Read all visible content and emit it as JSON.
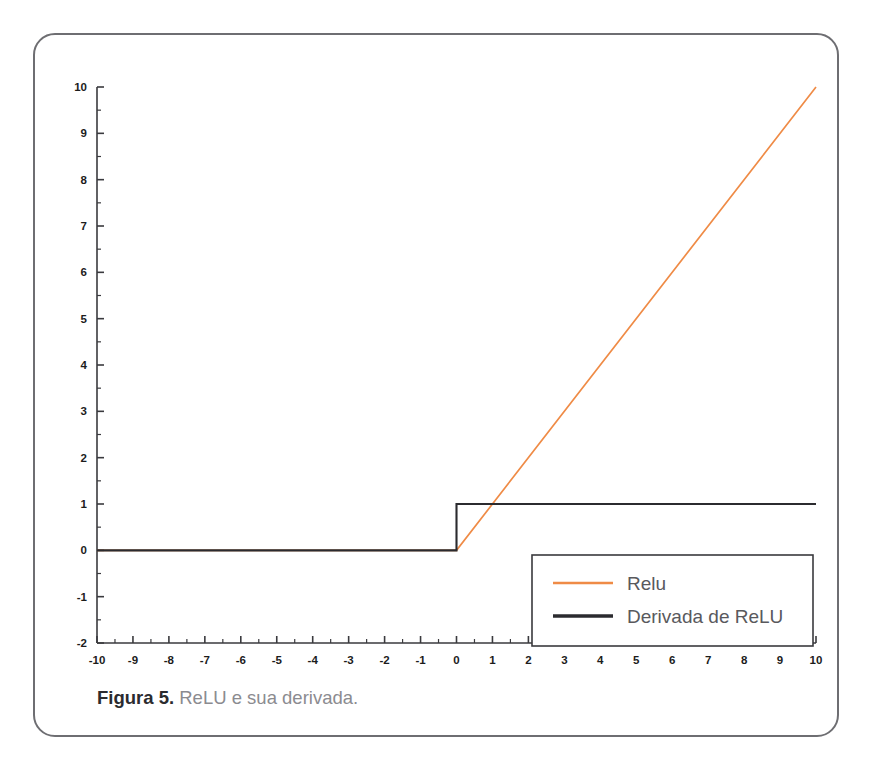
{
  "figure": {
    "caption_prefix": "Figura 5.",
    "caption_text": "ReLU e sua derivada."
  },
  "colors": {
    "relu_line": "#ef8b46",
    "derivative_line": "#2b2b2f",
    "axis": "#3a3a3e",
    "card_border": "#6e6e72",
    "caption_text": "#8b8b90",
    "caption_bold": "#2b2b2f",
    "legend_text": "#59595d",
    "background": "#ffffff"
  },
  "chart_data": {
    "type": "line",
    "title": "",
    "xlabel": "",
    "ylabel": "",
    "xlim": [
      -10,
      10
    ],
    "ylim": [
      -2,
      10
    ],
    "grid": false,
    "x_ticks": [
      -10,
      -9,
      -8,
      -7,
      -6,
      -5,
      -4,
      -3,
      -2,
      -1,
      0,
      1,
      2,
      3,
      4,
      5,
      6,
      7,
      8,
      9,
      10
    ],
    "x_tick_labels": [
      "-10",
      "-9",
      "-8",
      "-7",
      "-6",
      "-5",
      "-4",
      "-3",
      "-2",
      "-1",
      "0",
      "1",
      "2",
      "3",
      "4",
      "5",
      "6",
      "7",
      "8",
      "9",
      "10"
    ],
    "y_ticks": [
      -2,
      -1,
      0,
      1,
      2,
      3,
      4,
      5,
      6,
      7,
      8,
      9,
      10
    ],
    "y_tick_labels": [
      "-2",
      "-1",
      "0",
      "1",
      "2",
      "3",
      "4",
      "5",
      "6",
      "7",
      "8",
      "9",
      "10"
    ],
    "minor_tick_step": 0.5,
    "legend_position": "lower-right",
    "series": [
      {
        "name": "Relu",
        "color": "#ef8b46",
        "x": [
          -10,
          0,
          10
        ],
        "values": [
          0,
          0,
          10
        ]
      },
      {
        "name": "Derivada de ReLU",
        "color": "#2b2b2f",
        "x": [
          -10,
          0,
          0,
          10
        ],
        "values": [
          0,
          0,
          1,
          1
        ]
      }
    ]
  },
  "legend": {
    "items": [
      {
        "label": "Relu"
      },
      {
        "label": "Derivada de ReLU"
      }
    ]
  }
}
